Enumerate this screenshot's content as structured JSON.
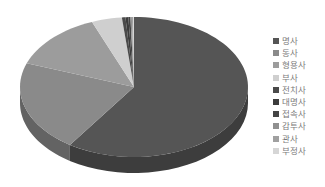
{
  "chart_data": {
    "type": "pie",
    "style": "3d",
    "title": "",
    "legend_position": "right",
    "categories": [
      "명사",
      "동사",
      "형용사",
      "부사",
      "전치사",
      "대명사",
      "접속사",
      "감투사",
      "관사",
      "부정사"
    ],
    "values": [
      59.5,
      21.0,
      13.5,
      4.3,
      0.5,
      0.4,
      0.3,
      0.2,
      0.2,
      0.1
    ],
    "colors": [
      "#555555",
      "#8a8a8a",
      "#9c9c9c",
      "#cfcfcf",
      "#4a4a4a",
      "#3c3c3c",
      "#444444",
      "#909090",
      "#a0a0a0",
      "#d6d6d6"
    ]
  },
  "legend": {
    "items": [
      {
        "label": "명사",
        "color": "#555555"
      },
      {
        "label": "동사",
        "color": "#8a8a8a"
      },
      {
        "label": "형용사",
        "color": "#9c9c9c"
      },
      {
        "label": "부사",
        "color": "#cfcfcf"
      },
      {
        "label": "전치사",
        "color": "#4a4a4a"
      },
      {
        "label": "대명사",
        "color": "#3c3c3c"
      },
      {
        "label": "접속사",
        "color": "#444444"
      },
      {
        "label": "감투사",
        "color": "#909090"
      },
      {
        "label": "관사",
        "color": "#a0a0a0"
      },
      {
        "label": "부정사",
        "color": "#d6d6d6"
      }
    ]
  }
}
